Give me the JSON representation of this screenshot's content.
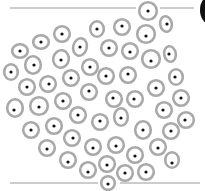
{
  "figure": {
    "colors": {
      "background": "#ffffff",
      "cell_wall": "#a9a9a9",
      "cell_interior": "#ffffff",
      "nucleus": "#111111",
      "boundary_line": "#9a9a9a",
      "corner_shape": "#111111"
    },
    "boundary_lines": [
      {
        "name": "top",
        "y": 8,
        "segments": [
          [
            10,
            136
          ],
          [
            160,
            194
          ]
        ]
      },
      {
        "name": "bottom",
        "y": 183,
        "segments": [
          [
            10,
            98
          ],
          [
            120,
            200
          ]
        ]
      }
    ],
    "cells": [
      {
        "cx": 148,
        "cy": 11,
        "rx": 10,
        "ry": 10,
        "rot": 0,
        "nx": 148,
        "ny": 11
      },
      {
        "cx": 166,
        "cy": 24,
        "rx": 7,
        "ry": 9,
        "rot": -10,
        "nx": 167,
        "ny": 24
      },
      {
        "cx": 97,
        "cy": 29,
        "rx": 8,
        "ry": 9,
        "rot": 0,
        "nx": 97,
        "ny": 29
      },
      {
        "cx": 122,
        "cy": 27,
        "rx": 9,
        "ry": 9,
        "rot": 0,
        "nx": 122,
        "ny": 26
      },
      {
        "cx": 146,
        "cy": 34,
        "rx": 10,
        "ry": 10,
        "rot": 0,
        "nx": 146,
        "ny": 36
      },
      {
        "cx": 62,
        "cy": 34,
        "rx": 9,
        "ry": 9,
        "rot": 0,
        "nx": 62,
        "ny": 34
      },
      {
        "cx": 41,
        "cy": 42,
        "rx": 9,
        "ry": 8,
        "rot": 0,
        "nx": 41,
        "ny": 42
      },
      {
        "cx": 20,
        "cy": 51,
        "rx": 9,
        "ry": 8,
        "rot": 0,
        "nx": 20,
        "ny": 51
      },
      {
        "cx": 80,
        "cy": 47,
        "rx": 8,
        "ry": 10,
        "rot": 15,
        "nx": 80,
        "ny": 47
      },
      {
        "cx": 109,
        "cy": 48,
        "rx": 9,
        "ry": 9,
        "rot": 0,
        "nx": 109,
        "ny": 48
      },
      {
        "cx": 130,
        "cy": 51,
        "rx": 9,
        "ry": 9,
        "rot": 0,
        "nx": 130,
        "ny": 52
      },
      {
        "cx": 151,
        "cy": 59,
        "rx": 10,
        "ry": 10,
        "rot": 0,
        "nx": 151,
        "ny": 61
      },
      {
        "cx": 170,
        "cy": 54,
        "rx": 7,
        "ry": 9,
        "rot": -10,
        "nx": 169,
        "ny": 54
      },
      {
        "cx": 61,
        "cy": 59,
        "rx": 9,
        "ry": 10,
        "rot": 10,
        "nx": 61,
        "ny": 60
      },
      {
        "cx": 33,
        "cy": 65,
        "rx": 9,
        "ry": 10,
        "rot": 0,
        "nx": 34,
        "ny": 65
      },
      {
        "cx": 11,
        "cy": 72,
        "rx": 8,
        "ry": 9,
        "rot": 0,
        "nx": 11,
        "ny": 72
      },
      {
        "cx": 90,
        "cy": 67,
        "rx": 9,
        "ry": 9,
        "rot": 0,
        "nx": 90,
        "ny": 67
      },
      {
        "cx": 71,
        "cy": 78,
        "rx": 9,
        "ry": 9,
        "rot": 0,
        "nx": 71,
        "ny": 78
      },
      {
        "cx": 106,
        "cy": 76,
        "rx": 9,
        "ry": 9,
        "rot": 0,
        "nx": 106,
        "ny": 76
      },
      {
        "cx": 128,
        "cy": 75,
        "rx": 9,
        "ry": 9,
        "rot": 0,
        "nx": 128,
        "ny": 74
      },
      {
        "cx": 176,
        "cy": 77,
        "rx": 8,
        "ry": 9,
        "rot": 0,
        "nx": 175,
        "ny": 77
      },
      {
        "cx": 27,
        "cy": 87,
        "rx": 9,
        "ry": 9,
        "rot": 0,
        "nx": 27,
        "ny": 87
      },
      {
        "cx": 48,
        "cy": 84,
        "rx": 9,
        "ry": 9,
        "rot": 0,
        "nx": 49,
        "ny": 84
      },
      {
        "cx": 89,
        "cy": 92,
        "rx": 9,
        "ry": 9,
        "rot": 0,
        "nx": 89,
        "ny": 91
      },
      {
        "cx": 114,
        "cy": 99,
        "rx": 9,
        "ry": 9,
        "rot": 0,
        "nx": 113,
        "ny": 98
      },
      {
        "cx": 135,
        "cy": 99,
        "rx": 9,
        "ry": 9,
        "rot": 0,
        "nx": 134,
        "ny": 99
      },
      {
        "cx": 156,
        "cy": 88,
        "rx": 9,
        "ry": 9,
        "rot": 0,
        "nx": 156,
        "ny": 88
      },
      {
        "cx": 181,
        "cy": 98,
        "rx": 9,
        "ry": 9,
        "rot": 0,
        "nx": 181,
        "ny": 98
      },
      {
        "cx": 15,
        "cy": 108,
        "rx": 9,
        "ry": 10,
        "rot": 0,
        "nx": 14,
        "ny": 110
      },
      {
        "cx": 39,
        "cy": 106,
        "rx": 10,
        "ry": 10,
        "rot": 0,
        "nx": 39,
        "ny": 107
      },
      {
        "cx": 63,
        "cy": 101,
        "rx": 9,
        "ry": 9,
        "rot": 0,
        "nx": 63,
        "ny": 101
      },
      {
        "cx": 78,
        "cy": 115,
        "rx": 9,
        "ry": 9,
        "rot": 0,
        "nx": 78,
        "ny": 115
      },
      {
        "cx": 100,
        "cy": 122,
        "rx": 9,
        "ry": 9,
        "rot": 0,
        "nx": 100,
        "ny": 121
      },
      {
        "cx": 121,
        "cy": 117,
        "rx": 8,
        "ry": 10,
        "rot": 0,
        "nx": 121,
        "ny": 118
      },
      {
        "cx": 143,
        "cy": 130,
        "rx": 9,
        "ry": 10,
        "rot": 0,
        "nx": 143,
        "ny": 130
      },
      {
        "cx": 164,
        "cy": 110,
        "rx": 9,
        "ry": 9,
        "rot": 0,
        "nx": 163,
        "ny": 110
      },
      {
        "cx": 186,
        "cy": 120,
        "rx": 9,
        "ry": 9,
        "rot": 0,
        "nx": 185,
        "ny": 120
      },
      {
        "cx": 171,
        "cy": 131,
        "rx": 9,
        "ry": 9,
        "rot": 0,
        "nx": 171,
        "ny": 131
      },
      {
        "cx": 31,
        "cy": 130,
        "rx": 9,
        "ry": 9,
        "rot": 0,
        "nx": 31,
        "ny": 130
      },
      {
        "cx": 54,
        "cy": 126,
        "rx": 9,
        "ry": 9,
        "rot": 0,
        "nx": 54,
        "ny": 126
      },
      {
        "cx": 72,
        "cy": 138,
        "rx": 9,
        "ry": 9,
        "rot": 0,
        "nx": 73,
        "ny": 138
      },
      {
        "cx": 93,
        "cy": 147,
        "rx": 9,
        "ry": 9,
        "rot": 0,
        "nx": 93,
        "ny": 148
      },
      {
        "cx": 116,
        "cy": 145,
        "rx": 9,
        "ry": 9,
        "rot": 0,
        "nx": 116,
        "ny": 146
      },
      {
        "cx": 135,
        "cy": 155,
        "rx": 9,
        "ry": 9,
        "rot": 0,
        "nx": 135,
        "ny": 156
      },
      {
        "cx": 158,
        "cy": 147,
        "rx": 9,
        "ry": 9,
        "rot": 0,
        "nx": 158,
        "ny": 148
      },
      {
        "cx": 172,
        "cy": 160,
        "rx": 8,
        "ry": 9,
        "rot": 0,
        "nx": 172,
        "ny": 163
      },
      {
        "cx": 47,
        "cy": 148,
        "rx": 9,
        "ry": 9,
        "rot": 0,
        "nx": 47,
        "ny": 149
      },
      {
        "cx": 68,
        "cy": 160,
        "rx": 9,
        "ry": 9,
        "rot": 0,
        "nx": 68,
        "ny": 162
      },
      {
        "cx": 88,
        "cy": 170,
        "rx": 9,
        "ry": 9,
        "rot": 0,
        "nx": 88,
        "ny": 172
      },
      {
        "cx": 107,
        "cy": 164,
        "rx": 9,
        "ry": 9,
        "rot": 0,
        "nx": 107,
        "ny": 165
      },
      {
        "cx": 125,
        "cy": 173,
        "rx": 9,
        "ry": 9,
        "rot": 0,
        "nx": 125,
        "ny": 173
      },
      {
        "cx": 146,
        "cy": 172,
        "rx": 9,
        "ry": 9,
        "rot": 0,
        "nx": 146,
        "ny": 172
      },
      {
        "cx": 108,
        "cy": 183,
        "rx": 8,
        "ry": 8,
        "rot": 0,
        "nx": 108,
        "ny": 184
      }
    ],
    "corner_shape": {
      "cx": 210,
      "cy": 10,
      "rx": 10,
      "ry": 14
    }
  }
}
